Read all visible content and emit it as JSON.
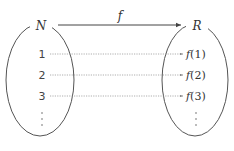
{
  "diagram": {
    "type": "function-mapping",
    "domain_set": {
      "label": "N"
    },
    "codomain_set": {
      "label": "R"
    },
    "mapping": {
      "label": "f"
    },
    "elements": [
      {
        "input": "1",
        "fname": "f",
        "arg": "1",
        "close": ")",
        "open": "("
      },
      {
        "input": "2",
        "fname": "f",
        "arg": "2",
        "close": ")",
        "open": "("
      },
      {
        "input": "3",
        "fname": "f",
        "arg": "3",
        "close": ")",
        "open": "("
      }
    ],
    "continuation": "⋮",
    "colors": {
      "stroke": "#555555",
      "dotted": "#999999",
      "text": "#333333"
    }
  }
}
